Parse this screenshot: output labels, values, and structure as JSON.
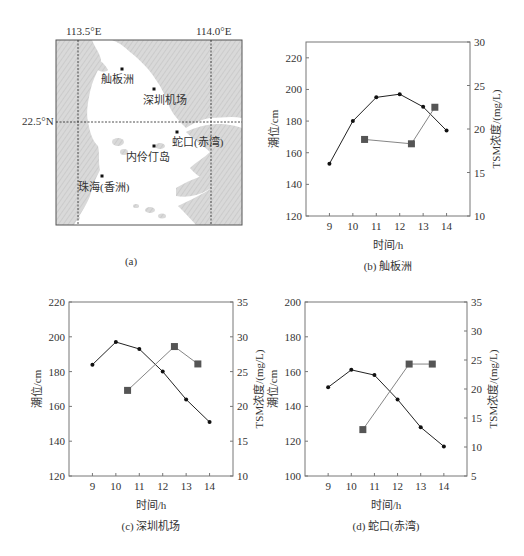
{
  "map": {
    "caption": "(a)",
    "lon_labels": [
      "113.5°E",
      "114.0°E"
    ],
    "lat_labels": [
      "22.5°N"
    ],
    "stations": [
      {
        "name": "舢板洲",
        "x": 122,
        "y": 69,
        "lx": 101,
        "ly": 83
      },
      {
        "name": "深圳机场",
        "x": 154,
        "y": 89,
        "lx": 143,
        "ly": 104
      },
      {
        "name": "蛇口(赤湾)",
        "x": 177,
        "y": 132,
        "lx": 172,
        "ly": 146
      },
      {
        "name": "内伶仃岛",
        "x": 154,
        "y": 146,
        "lx": 126,
        "ly": 161
      },
      {
        "name": "珠海(香洲)",
        "x": 102,
        "y": 176,
        "lx": 78,
        "ly": 191
      }
    ],
    "colors": {
      "land": "#d4d4d4",
      "water": "#ffffff",
      "frame": "#555555"
    }
  },
  "chart_data": [
    {
      "id": "b",
      "type": "line",
      "title": "(b) 舢板洲",
      "xlabel": "时间/h",
      "ylabel": "潮位/cm",
      "y2label": "TSM浓度/(mg/L)",
      "xlim": [
        8,
        15
      ],
      "x_ticks": [
        9,
        10,
        11,
        12,
        13,
        14
      ],
      "ylim": [
        120,
        230
      ],
      "y_ticks": [
        120,
        140,
        160,
        180,
        200,
        220
      ],
      "y2lim": [
        10,
        30
      ],
      "y2_ticks": [
        10,
        15,
        20,
        25,
        30
      ],
      "grid": false,
      "series": [
        {
          "name": "潮位",
          "axis": "left",
          "marker": "circle",
          "color": "#222222",
          "x": [
            9,
            10,
            11,
            12,
            13,
            14
          ],
          "values": [
            153,
            180,
            195,
            197,
            189,
            174
          ]
        },
        {
          "name": "TSM浓度",
          "axis": "right",
          "marker": "square",
          "color": "#777777",
          "x": [
            10.5,
            12.5,
            13.5
          ],
          "values": [
            18.8,
            18.3,
            22.5
          ]
        }
      ]
    },
    {
      "id": "c",
      "type": "line",
      "title": "(c) 深圳机场",
      "xlabel": "时间/h",
      "ylabel": "潮位/cm",
      "y2label": "TSM浓度/(mg/L)",
      "xlim": [
        8,
        15
      ],
      "x_ticks": [
        9,
        10,
        11,
        12,
        13,
        14
      ],
      "ylim": [
        120,
        220
      ],
      "y_ticks": [
        120,
        140,
        160,
        180,
        200,
        220
      ],
      "y2lim": [
        10,
        35
      ],
      "y2_ticks": [
        10,
        15,
        20,
        25,
        30,
        35
      ],
      "grid": false,
      "series": [
        {
          "name": "潮位",
          "axis": "left",
          "marker": "circle",
          "color": "#222222",
          "x": [
            9,
            10,
            11,
            12,
            13,
            14
          ],
          "values": [
            184,
            197,
            193,
            180,
            164,
            151
          ]
        },
        {
          "name": "TSM浓度",
          "axis": "right",
          "marker": "square",
          "color": "#777777",
          "x": [
            10.5,
            12.5,
            13.5
          ],
          "values": [
            22.3,
            28.6,
            26.1
          ]
        }
      ]
    },
    {
      "id": "d",
      "type": "line",
      "title": "(d) 蛇口(赤湾)",
      "xlabel": "时间/h",
      "ylabel": "潮位/cm",
      "y2label": "TSM浓度/(mg/L)",
      "xlim": [
        8,
        15
      ],
      "x_ticks": [
        9,
        10,
        11,
        12,
        13,
        14
      ],
      "ylim": [
        100,
        200
      ],
      "y_ticks": [
        100,
        120,
        140,
        160,
        180,
        200
      ],
      "y2lim": [
        5,
        35
      ],
      "y2_ticks": [
        5,
        10,
        15,
        20,
        25,
        30,
        35
      ],
      "grid": false,
      "series": [
        {
          "name": "潮位",
          "axis": "left",
          "marker": "circle",
          "color": "#222222",
          "x": [
            9,
            10,
            11,
            12,
            13,
            14
          ],
          "values": [
            151,
            161,
            158,
            144,
            128,
            117
          ]
        },
        {
          "name": "TSM浓度",
          "axis": "right",
          "marker": "square",
          "color": "#777777",
          "x": [
            10.5,
            12.5,
            13.5
          ],
          "values": [
            13.0,
            24.3,
            24.3
          ]
        }
      ]
    }
  ],
  "layout": {
    "frames": {
      "b": {
        "l": 306,
        "t": 42,
        "r": 470,
        "b": 216
      },
      "c": {
        "l": 69,
        "t": 302,
        "r": 233,
        "b": 476
      },
      "d": {
        "l": 305,
        "t": 302,
        "r": 467,
        "b": 476
      }
    }
  }
}
